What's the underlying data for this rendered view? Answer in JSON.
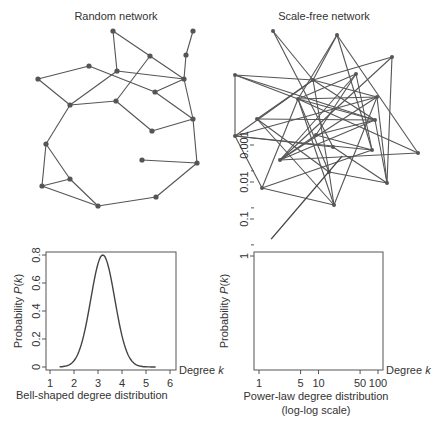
{
  "random_network": {
    "title": "Random network",
    "nodes": [
      [
        113,
        31
      ],
      [
        193,
        31
      ],
      [
        186,
        55
      ],
      [
        150,
        56
      ],
      [
        89,
        66
      ],
      [
        117,
        71
      ],
      [
        38,
        79
      ],
      [
        184,
        79
      ],
      [
        155,
        92
      ],
      [
        70,
        105
      ],
      [
        116,
        101
      ],
      [
        193,
        119
      ],
      [
        152,
        131
      ],
      [
        46,
        144
      ],
      [
        142,
        160
      ],
      [
        197,
        163
      ],
      [
        70,
        179
      ],
      [
        42,
        186
      ],
      [
        98,
        206
      ],
      [
        156,
        197
      ]
    ],
    "edges": [
      [
        0,
        5
      ],
      [
        0,
        3
      ],
      [
        3,
        7
      ],
      [
        1,
        2
      ],
      [
        2,
        7
      ],
      [
        3,
        10
      ],
      [
        6,
        4
      ],
      [
        4,
        8
      ],
      [
        6,
        9
      ],
      [
        5,
        7
      ],
      [
        5,
        9
      ],
      [
        7,
        8
      ],
      [
        8,
        11
      ],
      [
        7,
        11
      ],
      [
        10,
        9
      ],
      [
        10,
        12
      ],
      [
        12,
        11
      ],
      [
        11,
        15
      ],
      [
        14,
        15
      ],
      [
        15,
        19
      ],
      [
        19,
        18
      ],
      [
        9,
        13
      ],
      [
        13,
        16
      ],
      [
        13,
        17
      ],
      [
        17,
        16
      ],
      [
        17,
        18
      ],
      [
        16,
        18
      ]
    ]
  },
  "scale_free_network": {
    "title": "Scale-free network",
    "nodes": [
      [
        273,
        31
      ],
      [
        337,
        35
      ],
      [
        392,
        57
      ],
      [
        235,
        75
      ],
      [
        313,
        80
      ],
      [
        356,
        74
      ],
      [
        298,
        99
      ],
      [
        377,
        97
      ],
      [
        257,
        119
      ],
      [
        375,
        120
      ],
      [
        235,
        136
      ],
      [
        316,
        135
      ],
      [
        333,
        147
      ],
      [
        372,
        150
      ],
      [
        418,
        153
      ],
      [
        280,
        160
      ],
      [
        329,
        172
      ],
      [
        387,
        183
      ],
      [
        262,
        188
      ],
      [
        334,
        205
      ]
    ],
    "edges": [
      [
        0,
        4
      ],
      [
        0,
        12
      ],
      [
        1,
        4
      ],
      [
        1,
        6
      ],
      [
        1,
        13
      ],
      [
        1,
        14
      ],
      [
        2,
        4
      ],
      [
        2,
        17
      ],
      [
        2,
        15
      ],
      [
        3,
        4
      ],
      [
        3,
        10
      ],
      [
        3,
        9
      ],
      [
        3,
        6
      ],
      [
        4,
        8
      ],
      [
        4,
        10
      ],
      [
        4,
        7
      ],
      [
        4,
        16
      ],
      [
        4,
        9
      ],
      [
        5,
        6
      ],
      [
        5,
        13
      ],
      [
        5,
        15
      ],
      [
        5,
        11
      ],
      [
        6,
        9
      ],
      [
        6,
        16
      ],
      [
        6,
        19
      ],
      [
        6,
        18
      ],
      [
        6,
        7
      ],
      [
        7,
        10
      ],
      [
        7,
        17
      ],
      [
        7,
        19
      ],
      [
        7,
        15
      ],
      [
        8,
        9
      ],
      [
        8,
        16
      ],
      [
        8,
        19
      ],
      [
        9,
        11
      ],
      [
        9,
        15
      ],
      [
        9,
        17
      ],
      [
        10,
        12
      ],
      [
        10,
        18
      ],
      [
        10,
        13
      ],
      [
        11,
        15
      ],
      [
        11,
        13
      ],
      [
        12,
        17
      ],
      [
        13,
        18
      ],
      [
        14,
        15
      ],
      [
        16,
        17
      ],
      [
        16,
        19
      ],
      [
        18,
        19
      ],
      [
        6,
        14
      ]
    ]
  },
  "chart_data": [
    {
      "type": "line",
      "title": "Bell-shaped degree distribution",
      "xlabel": "Degree k",
      "ylabel": "Probability P(k)",
      "x_ticks": [
        "1",
        "2",
        "3",
        "4",
        "5",
        "6"
      ],
      "y_ticks": [
        "0",
        "0.2",
        "0.4",
        "0.6",
        "0.8"
      ],
      "xlim": [
        1,
        6
      ],
      "ylim": [
        0,
        0.8
      ],
      "series": [
        {
          "name": "P(k)",
          "distribution": "normal",
          "mean": 3.2,
          "sd": 0.5,
          "peak": 0.8,
          "x_range": [
            1.4,
            5.4
          ]
        }
      ]
    },
    {
      "type": "line",
      "title": "Power-law degree distribution (log-log scale)",
      "xlabel": "Degree k",
      "ylabel": "Probability P(k)",
      "x_scale": "log",
      "y_scale": "log",
      "x_ticks": [
        "1",
        "5",
        "10",
        "50",
        "100"
      ],
      "y_ticks": [
        "0.001",
        "0.01",
        "0.1",
        "1"
      ],
      "series": [
        {
          "name": "P(k)",
          "x": [
            1.6,
            25
          ],
          "y": [
            0.35,
            0.002
          ]
        }
      ]
    }
  ],
  "labels": {
    "bell_caption": "Bell-shaped degree distribution",
    "power_caption_1": "Power-law degree distribution",
    "power_caption_2": "(log-log scale)",
    "degree_label": "Degree k",
    "prob_label": "Probability P(k)"
  }
}
